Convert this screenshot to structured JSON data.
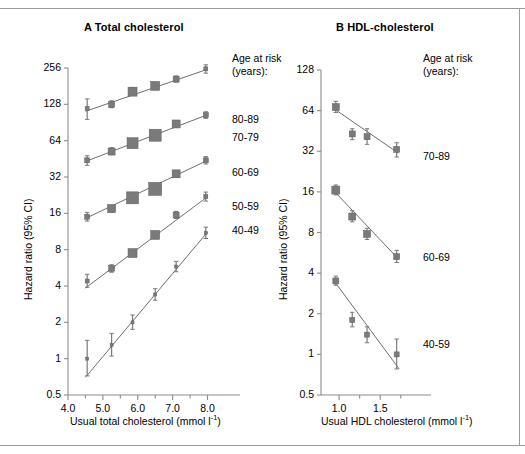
{
  "figure": {
    "background": "#ffffff",
    "marker_color": "#7a7a7a",
    "line_color": "#6e6e6e",
    "axis_color": "#8c8c8c"
  },
  "panel_a": {
    "title": "A Total cholesterol",
    "legend_head_line1": "Age at risk",
    "legend_head_line2": "(years):",
    "ylabel": "Hazard ratio (95% CI)",
    "xlabel_main": "Usual total cholesterol (mmol l",
    "xlabel_sup": "-1",
    "xlabel_tail": ")",
    "yticks": [
      "256",
      "128",
      "64",
      "32",
      "16",
      "8",
      "4",
      "2",
      "1",
      "0.5"
    ],
    "xticks": [
      "4.0",
      "5.0",
      "6.0",
      "7.0",
      "8.0"
    ],
    "series_labels": [
      "80-89",
      "70-79",
      "60-69",
      "50-59",
      "40-49"
    ]
  },
  "panel_b": {
    "title": "B HDL-cholesterol",
    "legend_head_line1": "Age at risk",
    "legend_head_line2": "(years):",
    "ylabel": "Hazard ratio (95% CI)",
    "xlabel_main": "Usual HDL cholesterol (mmol l",
    "xlabel_sup": "-1",
    "xlabel_tail": ")",
    "yticks": [
      "128",
      "64",
      "32",
      "16",
      "8",
      "4",
      "2",
      "1",
      "0.5"
    ],
    "xticks": [
      "1.0",
      "1.5"
    ],
    "series_labels": [
      "70-89",
      "60-69",
      "40-59"
    ]
  },
  "chart_data": [
    {
      "type": "scatter",
      "panel": "A",
      "title": "A Total cholesterol",
      "xlabel": "Usual total cholesterol (mmol l-1)",
      "ylabel": "Hazard ratio (95% CI)",
      "xscale": "linear",
      "yscale": "log2",
      "xlim": [
        4.0,
        8.3
      ],
      "ylim": [
        0.5,
        256
      ],
      "xticks": [
        4.0,
        5.0,
        6.0,
        7.0,
        8.0
      ],
      "xminorticks": [
        4.5,
        5.5,
        6.5,
        7.5
      ],
      "yticks": [
        0.5,
        1,
        2,
        4,
        8,
        16,
        32,
        64,
        128,
        256
      ],
      "grid": false,
      "legend_position": "right",
      "errorbars": "95% CI",
      "series": [
        {
          "name": "80-89",
          "x": [
            4.55,
            5.25,
            5.85,
            6.5,
            7.1,
            7.95
          ],
          "values": [
            118,
            128,
            163,
            182,
            207,
            252
          ],
          "ci_low": [
            96,
            120,
            152,
            172,
            196,
            232
          ],
          "ci_high": [
            142,
            137,
            176,
            194,
            220,
            272
          ],
          "marker_sizes": [
            4,
            6,
            9,
            9,
            6,
            4
          ],
          "fit_start": [
            4.5,
            112
          ],
          "fit_end": [
            8.0,
            250
          ]
        },
        {
          "name": "70-79",
          "x": [
            4.55,
            5.25,
            5.85,
            6.5,
            7.1,
            7.95
          ],
          "values": [
            44,
            52,
            61,
            71,
            88,
            104
          ],
          "ci_low": [
            40,
            49,
            56,
            66,
            83,
            98
          ],
          "ci_high": [
            48,
            56,
            66,
            77,
            94,
            111
          ],
          "marker_sizes": [
            5,
            7,
            11,
            12,
            8,
            5
          ],
          "fit_start": [
            4.5,
            43
          ],
          "fit_end": [
            8.0,
            105
          ]
        },
        {
          "name": "60-69",
          "x": [
            4.55,
            5.25,
            5.85,
            6.5,
            7.1,
            7.95
          ],
          "values": [
            15.0,
            17.5,
            21.5,
            25.5,
            34.0,
            44.0
          ],
          "ci_low": [
            13.8,
            16.4,
            20.2,
            24.0,
            32.0,
            41.0
          ],
          "ci_high": [
            16.3,
            18.7,
            22.9,
            27.1,
            36.1,
            47.2
          ],
          "marker_sizes": [
            5,
            8,
            12,
            13,
            8,
            5
          ],
          "fit_start": [
            4.5,
            14.5
          ],
          "fit_end": [
            8.0,
            44
          ]
        },
        {
          "name": "50-59",
          "x": [
            4.55,
            5.25,
            5.85,
            6.5,
            7.1,
            7.95
          ],
          "values": [
            4.4,
            5.6,
            7.5,
            10.6,
            15.5,
            22.0
          ],
          "ci_low": [
            3.9,
            5.2,
            7.0,
            9.9,
            14.5,
            20.2
          ],
          "ci_high": [
            5.0,
            6.0,
            8.0,
            11.3,
            16.6,
            24.0
          ],
          "marker_sizes": [
            4,
            6,
            9,
            9,
            6,
            4
          ],
          "fit_start": [
            4.5,
            3.85
          ],
          "fit_end": [
            8.0,
            22.0
          ]
        },
        {
          "name": "40-49",
          "x": [
            4.55,
            5.25,
            5.85,
            6.5,
            7.1,
            7.95
          ],
          "values": [
            1.0,
            1.3,
            2.0,
            3.4,
            5.8,
            11.0
          ],
          "ci_low": [
            0.72,
            1.05,
            1.75,
            3.05,
            5.25,
            9.9
          ],
          "ci_high": [
            1.42,
            1.62,
            2.3,
            3.8,
            6.4,
            12.3
          ],
          "marker_sizes": [
            3,
            3,
            3,
            3,
            3,
            3
          ],
          "fit_start": [
            4.5,
            0.7
          ],
          "fit_end": [
            8.0,
            11.2
          ]
        }
      ]
    },
    {
      "type": "scatter",
      "panel": "B",
      "title": "B HDL-cholesterol",
      "xlabel": "Usual HDL cholesterol (mmol l-1)",
      "ylabel": "Hazard ratio (95% CI)",
      "xscale": "linear",
      "yscale": "log2",
      "xlim": [
        0.78,
        1.85
      ],
      "ylim": [
        0.5,
        128
      ],
      "xticks": [
        1.0,
        1.5
      ],
      "xminorticks": [
        1.25,
        1.75
      ],
      "yticks": [
        0.5,
        1,
        2,
        4,
        8,
        16,
        32,
        64,
        128
      ],
      "grid": false,
      "legend_position": "right",
      "errorbars": "95% CI",
      "series": [
        {
          "name": "70-89",
          "x": [
            0.96,
            1.16,
            1.34,
            1.7
          ],
          "values": [
            68,
            43,
            41,
            33
          ],
          "ci_low": [
            62,
            39,
            36,
            29
          ],
          "ci_high": [
            75,
            47,
            47,
            37
          ],
          "marker_sizes": [
            7,
            6,
            6,
            6
          ],
          "fit_start": [
            0.94,
            66
          ],
          "fit_end": [
            1.72,
            31
          ]
        },
        {
          "name": "60-69",
          "x": [
            0.96,
            1.16,
            1.34,
            1.7
          ],
          "values": [
            16.5,
            10.5,
            7.8,
            5.3
          ],
          "ci_low": [
            15.2,
            9.6,
            7.1,
            4.8
          ],
          "ci_high": [
            18.0,
            11.6,
            8.6,
            5.9
          ],
          "marker_sizes": [
            8,
            7,
            7,
            6
          ],
          "fit_start": [
            0.94,
            16.2
          ],
          "fit_end": [
            1.72,
            5.1
          ]
        },
        {
          "name": "40-59",
          "x": [
            0.96,
            1.16,
            1.34,
            1.7
          ],
          "values": [
            3.5,
            1.8,
            1.4,
            1.0
          ],
          "ci_low": [
            3.25,
            1.6,
            1.22,
            0.78
          ],
          "ci_high": [
            3.8,
            2.05,
            1.6,
            1.3
          ],
          "marker_sizes": [
            6,
            5,
            5,
            5
          ],
          "fit_start": [
            0.97,
            3.3
          ],
          "fit_end": [
            1.73,
            0.78
          ]
        }
      ]
    }
  ]
}
